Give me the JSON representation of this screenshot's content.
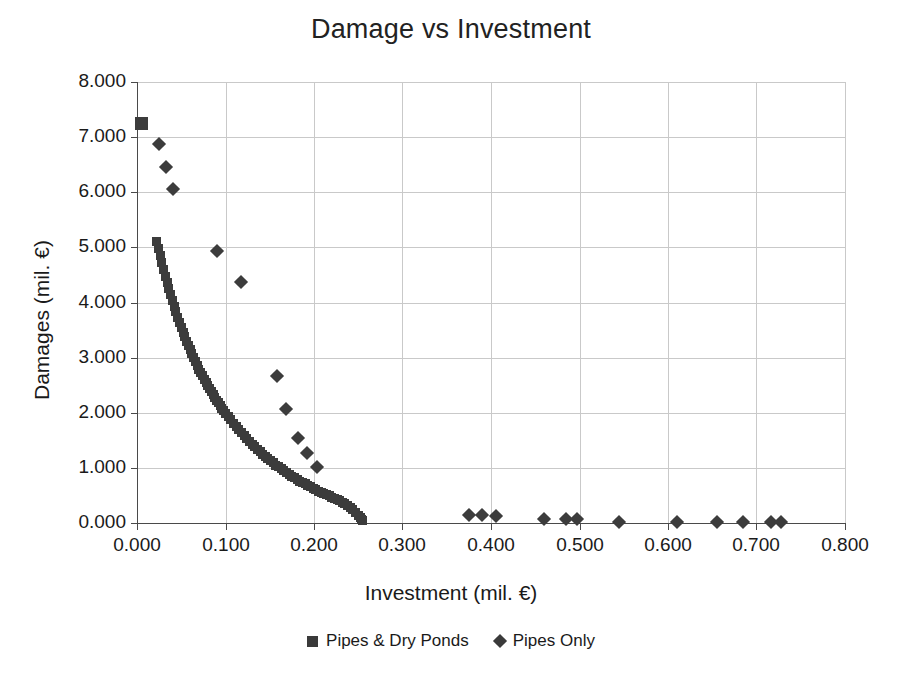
{
  "chart_data": {
    "type": "scatter",
    "title": "Damage vs Investment",
    "xlabel": "Investment (mil. €)",
    "ylabel": "Damages (mil. €)",
    "xlim": [
      0.0,
      0.8
    ],
    "ylim": [
      0.0,
      8.0
    ],
    "xticks": [
      "0.000",
      "0.100",
      "0.200",
      "0.300",
      "0.400",
      "0.500",
      "0.600",
      "0.700",
      "0.800"
    ],
    "xtick_values": [
      0.0,
      0.1,
      0.2,
      0.3,
      0.4,
      0.5,
      0.6,
      0.7,
      0.8
    ],
    "yticks": [
      "0.000",
      "1.000",
      "2.000",
      "3.000",
      "4.000",
      "5.000",
      "6.000",
      "7.000",
      "8.000"
    ],
    "ytick_values": [
      0.0,
      1.0,
      2.0,
      3.0,
      4.0,
      5.0,
      6.0,
      7.0,
      8.0
    ],
    "grid": true,
    "legend_position": "bottom",
    "marker_color": "#3c3c3c",
    "grid_color": "#c9c9c9",
    "axis_color": "#4a4a4a",
    "series": [
      {
        "name": "Pipes & Dry Ponds",
        "marker": "square",
        "points": [
          [
            0.005,
            7.25
          ],
          [
            0.022,
            5.1
          ],
          [
            0.024,
            4.98
          ],
          [
            0.026,
            4.85
          ],
          [
            0.028,
            4.72
          ],
          [
            0.03,
            4.6
          ],
          [
            0.032,
            4.48
          ],
          [
            0.034,
            4.36
          ],
          [
            0.036,
            4.25
          ],
          [
            0.038,
            4.14
          ],
          [
            0.04,
            4.03
          ],
          [
            0.042,
            3.93
          ],
          [
            0.044,
            3.83
          ],
          [
            0.046,
            3.73
          ],
          [
            0.048,
            3.64
          ],
          [
            0.05,
            3.55
          ],
          [
            0.052,
            3.46
          ],
          [
            0.054,
            3.38
          ],
          [
            0.056,
            3.3
          ],
          [
            0.058,
            3.22
          ],
          [
            0.06,
            3.14
          ],
          [
            0.062,
            3.07
          ],
          [
            0.064,
            3.0
          ],
          [
            0.066,
            2.93
          ],
          [
            0.068,
            2.86
          ],
          [
            0.07,
            2.79
          ],
          [
            0.072,
            2.73
          ],
          [
            0.074,
            2.67
          ],
          [
            0.076,
            2.61
          ],
          [
            0.078,
            2.55
          ],
          [
            0.08,
            2.49
          ],
          [
            0.082,
            2.44
          ],
          [
            0.084,
            2.38
          ],
          [
            0.086,
            2.33
          ],
          [
            0.088,
            2.28
          ],
          [
            0.09,
            2.23
          ],
          [
            0.092,
            2.18
          ],
          [
            0.094,
            2.13
          ],
          [
            0.096,
            2.08
          ],
          [
            0.098,
            2.04
          ],
          [
            0.1,
            1.99
          ],
          [
            0.103,
            1.93
          ],
          [
            0.106,
            1.87
          ],
          [
            0.109,
            1.81
          ],
          [
            0.112,
            1.75
          ],
          [
            0.115,
            1.69
          ],
          [
            0.118,
            1.64
          ],
          [
            0.121,
            1.58
          ],
          [
            0.124,
            1.53
          ],
          [
            0.127,
            1.48
          ],
          [
            0.13,
            1.43
          ],
          [
            0.133,
            1.38
          ],
          [
            0.136,
            1.34
          ],
          [
            0.139,
            1.29
          ],
          [
            0.142,
            1.25
          ],
          [
            0.145,
            1.21
          ],
          [
            0.148,
            1.17
          ],
          [
            0.151,
            1.13
          ],
          [
            0.154,
            1.09
          ],
          [
            0.157,
            1.05
          ],
          [
            0.16,
            1.02
          ],
          [
            0.163,
            0.98
          ],
          [
            0.166,
            0.95
          ],
          [
            0.169,
            0.92
          ],
          [
            0.172,
            0.88
          ],
          [
            0.175,
            0.85
          ],
          [
            0.178,
            0.82
          ],
          [
            0.181,
            0.79
          ],
          [
            0.184,
            0.76
          ],
          [
            0.187,
            0.74
          ],
          [
            0.19,
            0.71
          ],
          [
            0.193,
            0.68
          ],
          [
            0.196,
            0.66
          ],
          [
            0.199,
            0.63
          ],
          [
            0.202,
            0.61
          ],
          [
            0.205,
            0.58
          ],
          [
            0.208,
            0.56
          ],
          [
            0.211,
            0.54
          ],
          [
            0.214,
            0.51
          ],
          [
            0.217,
            0.49
          ],
          [
            0.22,
            0.47
          ],
          [
            0.223,
            0.45
          ],
          [
            0.226,
            0.43
          ],
          [
            0.229,
            0.4
          ],
          [
            0.232,
            0.38
          ],
          [
            0.235,
            0.35
          ],
          [
            0.238,
            0.32
          ],
          [
            0.241,
            0.28
          ],
          [
            0.244,
            0.24
          ],
          [
            0.247,
            0.19
          ],
          [
            0.25,
            0.14
          ],
          [
            0.252,
            0.1
          ],
          [
            0.254,
            0.07
          ],
          [
            0.2545,
            0.05
          ],
          [
            0.255,
            0.04
          ]
        ]
      },
      {
        "name": "Pipes Only",
        "marker": "diamond",
        "points": [
          [
            0.025,
            6.87
          ],
          [
            0.033,
            6.45
          ],
          [
            0.041,
            6.05
          ],
          [
            0.09,
            4.94
          ],
          [
            0.118,
            4.37
          ],
          [
            0.158,
            2.66
          ],
          [
            0.168,
            2.06
          ],
          [
            0.182,
            1.55
          ],
          [
            0.192,
            1.27
          ],
          [
            0.203,
            1.02
          ],
          [
            0.375,
            0.14
          ],
          [
            0.39,
            0.14
          ],
          [
            0.406,
            0.12
          ],
          [
            0.46,
            0.08
          ],
          [
            0.485,
            0.07
          ],
          [
            0.497,
            0.07
          ],
          [
            0.545,
            0.02
          ],
          [
            0.61,
            0.01
          ],
          [
            0.655,
            0.01
          ],
          [
            0.685,
            0.01
          ],
          [
            0.716,
            0.01
          ],
          [
            0.728,
            0.01
          ]
        ]
      }
    ]
  },
  "legend": {
    "entries": [
      {
        "label": "Pipes & Dry Ponds",
        "marker": "square"
      },
      {
        "label": "Pipes Only",
        "marker": "diamond"
      }
    ]
  }
}
